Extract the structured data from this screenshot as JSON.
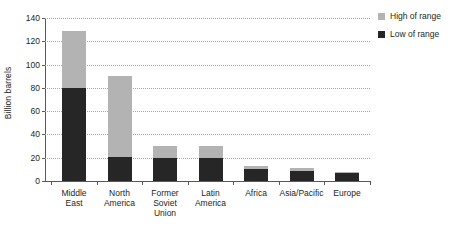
{
  "chart_data": {
    "type": "bar",
    "stacked": true,
    "title": "",
    "xlabel": "",
    "ylabel": "Billion barrels",
    "ylim": [
      0,
      140
    ],
    "yticks": [
      0,
      20,
      40,
      60,
      80,
      100,
      120,
      140
    ],
    "grid": true,
    "legend_position": "right",
    "categories": [
      "Middle East",
      "North America",
      "Former Soviet Union",
      "Latin America",
      "Africa",
      "Asia/Pacific",
      "Europe"
    ],
    "category_lines": [
      [
        "Middle",
        "East"
      ],
      [
        "North",
        "America"
      ],
      [
        "Former",
        "Soviet",
        "Union"
      ],
      [
        "Latin",
        "America"
      ],
      [
        "Africa"
      ],
      [
        "Asia/Pacific"
      ],
      [
        "Europe"
      ]
    ],
    "series": [
      {
        "name": "Low of range",
        "color": "#262626",
        "values": [
          80,
          21,
          20,
          20,
          10,
          9,
          7
        ]
      },
      {
        "name": "High of range",
        "color": "#b3b3b3",
        "values": [
          129,
          90,
          30,
          30,
          13,
          11,
          8
        ]
      }
    ],
    "segment_heights": {
      "low": [
        80,
        21,
        20,
        20,
        10,
        9,
        7
      ],
      "high_extra": [
        49,
        69,
        10,
        10,
        3,
        2,
        1
      ]
    }
  },
  "legend": {
    "items": [
      {
        "label": "High of range",
        "color": "#b3b3b3"
      },
      {
        "label": "Low of range",
        "color": "#262626"
      }
    ]
  },
  "axis": {
    "y_title": "Billion barrels",
    "y_tick_labels": [
      "140",
      "120",
      "100",
      "80",
      "60",
      "40",
      "20",
      "0"
    ]
  }
}
